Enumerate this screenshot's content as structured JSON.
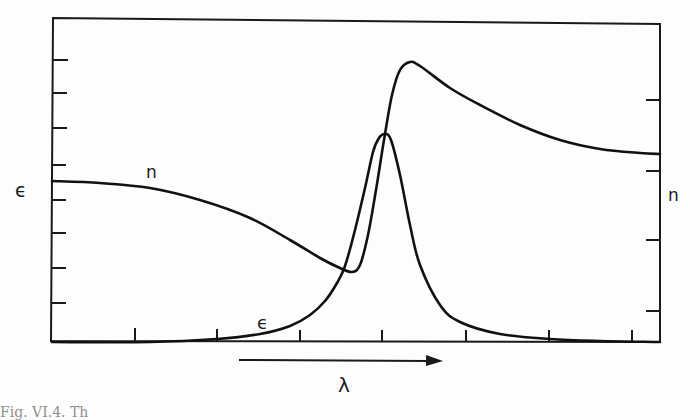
{
  "chart_data": {
    "type": "line",
    "title": "",
    "xlabel": "λ",
    "ylabel_left": "ϵ",
    "ylabel_right": "n",
    "x_direction_note": "arrow indicating increasing λ",
    "grid": false,
    "legend": "inline curve labels",
    "x_ticks_count": 7,
    "left_ticks_count": 8,
    "right_ticks_count": 4,
    "series": [
      {
        "name": "n",
        "label": "n",
        "description": "refractive index — anomalous dispersion: slowly decreasing, minimum just before resonance, sharp rise to maximum, then decays to a constant",
        "points_px": [
          [
            52,
            181
          ],
          [
            100,
            183
          ],
          [
            150,
            188
          ],
          [
            200,
            200
          ],
          [
            250,
            218
          ],
          [
            290,
            240
          ],
          [
            320,
            258
          ],
          [
            340,
            268
          ],
          [
            352,
            272
          ],
          [
            360,
            265
          ],
          [
            368,
            235
          ],
          [
            376,
            190
          ],
          [
            384,
            140
          ],
          [
            392,
            95
          ],
          [
            400,
            70
          ],
          [
            410,
            62
          ],
          [
            420,
            66
          ],
          [
            450,
            88
          ],
          [
            480,
            105
          ],
          [
            520,
            125
          ],
          [
            560,
            140
          ],
          [
            600,
            149
          ],
          [
            640,
            153
          ],
          [
            660,
            154
          ]
        ]
      },
      {
        "name": "epsilon",
        "label": "ϵ",
        "description": "absorption — Lorentzian peak at resonance",
        "points_px": [
          [
            52,
            342
          ],
          [
            150,
            342
          ],
          [
            217,
            339
          ],
          [
            260,
            334
          ],
          [
            290,
            326
          ],
          [
            310,
            315
          ],
          [
            325,
            301
          ],
          [
            337,
            283
          ],
          [
            345,
            266
          ],
          [
            355,
            230
          ],
          [
            365,
            188
          ],
          [
            373,
            152
          ],
          [
            379,
            138
          ],
          [
            385,
            134
          ],
          [
            391,
            140
          ],
          [
            400,
            175
          ],
          [
            410,
            225
          ],
          [
            420,
            265
          ],
          [
            440,
            305
          ],
          [
            460,
            322
          ],
          [
            500,
            334
          ],
          [
            550,
            339
          ],
          [
            600,
            341
          ],
          [
            660,
            342
          ]
        ]
      }
    ],
    "annotations": [
      {
        "text": "n",
        "near": "left part of n curve",
        "px": [
          124,
          176
        ]
      },
      {
        "text": "ϵ",
        "near": "rising foot of ϵ curve",
        "px": [
          265,
          325
        ]
      }
    ]
  },
  "labels": {
    "left_axis": "ϵ",
    "right_axis": "n",
    "x_axis": "λ",
    "n_curve": "n",
    "eps_curve": "ϵ"
  },
  "caption": "Fig. VI.4. Th"
}
